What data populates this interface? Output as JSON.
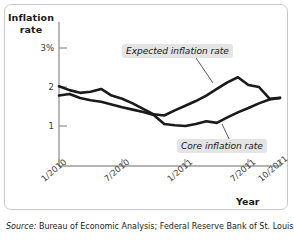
{
  "figure": {
    "y_axis_title": "Inflation rate",
    "x_axis_title": "Year",
    "source_lead": "Source:",
    "source_text": " Bureau of Economic Analysis; Federal Reserve Bank of St. Louis.",
    "colors": {
      "line": "#1a1a1a",
      "axis": "#9a9a9a",
      "frame": "#c9c9c9",
      "label_background": "#e4e4e4",
      "text": "#1a1a1a"
    }
  },
  "chart_data": {
    "type": "line",
    "title": "",
    "subtitle": "",
    "xlabel": "Year",
    "ylabel": "Inflation rate",
    "ylim": [
      0,
      3.4
    ],
    "xlim": [
      0,
      21
    ],
    "grid": false,
    "legend_position": "inline-annotation",
    "ytick_labels": [
      "3%",
      "2",
      "1"
    ],
    "ytick_values": [
      3,
      2,
      1
    ],
    "xtick_labels": [
      "1/2010",
      "7/2010",
      "1/2011",
      "7/2011",
      "10/2011"
    ],
    "xtick_values": [
      0,
      6,
      12,
      18,
      21
    ],
    "annotations": [
      {
        "text": "Expected inflation rate",
        "x": 9.0,
        "y": 2.82
      },
      {
        "text": "Core inflation rate",
        "x": 14.6,
        "y": 0.7
      }
    ],
    "series": [
      {
        "name": "Expected inflation rate",
        "x": [
          0,
          1,
          2,
          3,
          4,
          5,
          6,
          7,
          8,
          9,
          10,
          11,
          12,
          13,
          14,
          15,
          16,
          17,
          18,
          19,
          20,
          21
        ],
        "values": [
          2.02,
          1.92,
          1.85,
          1.88,
          1.95,
          1.78,
          1.7,
          1.58,
          1.44,
          1.3,
          1.27,
          1.4,
          1.52,
          1.64,
          1.78,
          1.95,
          2.12,
          2.25,
          2.05,
          2.0,
          1.7,
          1.72
        ]
      },
      {
        "name": "Core inflation rate",
        "x": [
          0,
          1,
          2,
          3,
          4,
          5,
          6,
          7,
          8,
          9,
          10,
          11,
          12,
          13,
          14,
          15,
          16,
          17,
          18,
          19,
          20,
          21
        ],
        "values": [
          1.78,
          1.82,
          1.72,
          1.66,
          1.62,
          1.55,
          1.48,
          1.42,
          1.36,
          1.28,
          1.05,
          1.02,
          1.0,
          1.05,
          1.12,
          1.08,
          1.22,
          1.35,
          1.46,
          1.58,
          1.68,
          1.72
        ]
      }
    ]
  }
}
